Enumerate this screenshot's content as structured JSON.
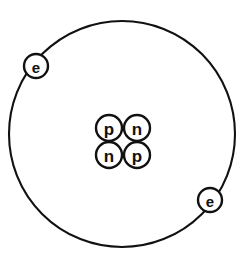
{
  "figure": {
    "background_color": "#ffffff",
    "line_color": "#111111"
  },
  "orbit": {
    "name": "electron-orbit",
    "center_x": 122,
    "center_y": 134,
    "radius": 113,
    "stroke_color": "#111111"
  },
  "nucleus": {
    "label": "nucleus",
    "center_x": 123,
    "center_y": 142,
    "particle_radius": 13,
    "particles": [
      {
        "symbol": "p",
        "name": "proton",
        "cx": 109,
        "cy": 128
      },
      {
        "symbol": "n",
        "name": "neutron",
        "cx": 137,
        "cy": 128
      },
      {
        "symbol": "n",
        "name": "neutron",
        "cx": 109,
        "cy": 155
      },
      {
        "symbol": "p",
        "name": "proton",
        "cx": 137,
        "cy": 155
      }
    ]
  },
  "electrons": [
    {
      "symbol": "e",
      "name": "electron-upper-left",
      "cx": 36,
      "cy": 66,
      "r": 12
    },
    {
      "symbol": "e",
      "name": "electron-lower-right",
      "cx": 210,
      "cy": 200,
      "r": 12
    }
  ],
  "counts": {
    "protons": 2,
    "neutrons": 2,
    "electrons": 2
  }
}
